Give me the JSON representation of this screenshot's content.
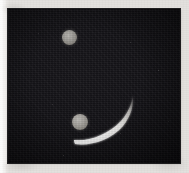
{
  "image": {
    "kind": "astronomical-plate-photograph",
    "width_px": 189,
    "height_px": 173,
    "caption": "",
    "title": ""
  },
  "paper": {
    "label": "scanned page background",
    "color": "#f2f1ef",
    "edge_color": "#e2e0dd"
  },
  "plate": {
    "label": "dark sky field",
    "background_color": "#121115",
    "deep_color": "#070608",
    "left_px": 8,
    "top_px": 9,
    "width_px": 172,
    "height_px": 154
  },
  "objects": [
    {
      "id": "disk-upper",
      "name": "upper gray disk",
      "shape": "circle",
      "center_x_px": 69,
      "center_y_px": 37,
      "diameter_px": 15,
      "color": "#9d9b96",
      "brightness": "medium-gray"
    },
    {
      "id": "disk-lower",
      "name": "lower gray disk",
      "shape": "circle",
      "center_x_px": 80,
      "center_y_px": 122,
      "diameter_px": 16,
      "color": "#a6a39e",
      "brightness": "medium-gray"
    },
    {
      "id": "crescent-arc",
      "name": "bright crescent arc",
      "shape": "crescent",
      "color": "#ffffff",
      "start_x_px": 76,
      "start_y_px": 139,
      "end_x_px": 132,
      "end_y_px": 93,
      "max_thickness_px": 4,
      "min_thickness_px": 1,
      "brightness": "white-saturated",
      "orientation": "concave-up-right"
    }
  ],
  "stars": [
    {
      "x_px": 30,
      "y_px": 24,
      "size_px": 1
    },
    {
      "x_px": 122,
      "y_px": 33,
      "size_px": 1
    },
    {
      "x_px": 150,
      "y_px": 61,
      "size_px": 1
    },
    {
      "x_px": 44,
      "y_px": 95,
      "size_px": 1
    },
    {
      "x_px": 112,
      "y_px": 124,
      "size_px": 1
    },
    {
      "x_px": 55,
      "y_px": 146,
      "size_px": 1
    },
    {
      "x_px": 160,
      "y_px": 112,
      "size_px": 1
    }
  ],
  "colors": {
    "background": "#121115",
    "disk": "#9d9b96",
    "arc": "#ffffff",
    "paper": "#f2f1ef"
  }
}
